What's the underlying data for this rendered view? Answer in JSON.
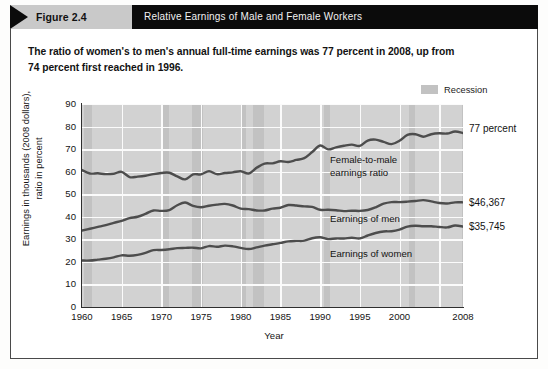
{
  "header": {
    "figure_number": "Figure 2.4",
    "title": "Relative Earnings of Male and Female Workers"
  },
  "subtitle": "The ratio of women's to men's annual full-time earnings was 77 percent in 2008, up from 74 percent first reached in 1996.",
  "legend": {
    "recession_label": "Recession",
    "recession_color": "#c2c2c2"
  },
  "annotations": {
    "ratio_note": "Female-to-male\nearnings ratio",
    "men_note": "Earnings of men",
    "women_note": "Earnings of women",
    "ratio_end": "77 percent",
    "men_end": "$46,367",
    "women_end": "$35,745"
  },
  "axes": {
    "ylabel": "Earnings in thousands (2008 dollars),\nratio in percent",
    "xlabel": "Year",
    "yticks": [
      "90",
      "80",
      "70",
      "60",
      "50",
      "40",
      "30",
      "20",
      "10",
      "0"
    ],
    "xticks": [
      "1960",
      "1965",
      "1970",
      "1975",
      "1980",
      "1985",
      "1990",
      "1995",
      "2000",
      "2008"
    ]
  },
  "chart_data": {
    "type": "line",
    "title": "Relative Earnings of Male and Female Workers",
    "subtitle": "The ratio of women's to men's annual full-time earnings was 77 percent in 2008, up from 74 percent first reached in 1996.",
    "xlabel": "Year",
    "ylabel": "Earnings in thousands (2008 dollars), ratio in percent",
    "xlim": [
      1960,
      2008
    ],
    "ylim": [
      0,
      90
    ],
    "ytick_step": 10,
    "grid": true,
    "legend_position": "top-right",
    "line_color": "#4d4d4d",
    "plot_background": "#d2d2d2",
    "x": [
      1960,
      1961,
      1962,
      1963,
      1964,
      1965,
      1966,
      1967,
      1968,
      1969,
      1970,
      1971,
      1972,
      1973,
      1974,
      1975,
      1976,
      1977,
      1978,
      1979,
      1980,
      1981,
      1982,
      1983,
      1984,
      1985,
      1986,
      1987,
      1988,
      1989,
      1990,
      1991,
      1992,
      1993,
      1994,
      1995,
      1996,
      1997,
      1998,
      1999,
      2000,
      2001,
      2002,
      2003,
      2004,
      2005,
      2006,
      2007,
      2008
    ],
    "series": [
      {
        "name": "Female-to-male earnings ratio",
        "unit": "percent",
        "end_label": "77 percent",
        "values": [
          60.7,
          59.2,
          59.3,
          58.9,
          59.1,
          59.9,
          57.6,
          57.8,
          58.2,
          58.9,
          59.4,
          59.5,
          57.9,
          56.6,
          58.8,
          58.8,
          60.2,
          58.9,
          59.4,
          59.7,
          60.2,
          59.2,
          61.7,
          63.6,
          63.7,
          64.6,
          64.3,
          65.2,
          66.0,
          68.7,
          71.6,
          69.9,
          70.8,
          71.5,
          72.0,
          71.4,
          73.8,
          74.2,
          73.2,
          72.2,
          73.7,
          76.3,
          76.6,
          75.5,
          76.6,
          77.0,
          76.9,
          77.8,
          77.1
        ]
      },
      {
        "name": "Earnings of men",
        "unit": "thousands of 2008 dollars",
        "end_label": "$46,367",
        "values": [
          33.9,
          34.7,
          35.5,
          36.3,
          37.3,
          38.2,
          39.4,
          40.0,
          41.3,
          42.8,
          42.6,
          43.0,
          45.1,
          46.3,
          44.8,
          44.2,
          44.9,
          45.4,
          45.7,
          45.0,
          43.6,
          43.4,
          42.8,
          42.8,
          43.6,
          44.0,
          45.2,
          45.0,
          44.6,
          44.4,
          43.1,
          43.1,
          42.9,
          42.5,
          42.7,
          42.6,
          43.0,
          44.2,
          45.8,
          46.5,
          46.5,
          46.7,
          47.0,
          47.4,
          46.8,
          46.1,
          45.9,
          46.4,
          46.4
        ]
      },
      {
        "name": "Earnings of women",
        "unit": "thousands of 2008 dollars",
        "end_label": "$35,745",
        "values": [
          20.6,
          20.6,
          21.0,
          21.4,
          22.0,
          22.9,
          22.7,
          23.1,
          24.0,
          25.2,
          25.3,
          25.6,
          26.1,
          26.2,
          26.3,
          26.0,
          27.0,
          26.7,
          27.2,
          26.9,
          26.2,
          25.7,
          26.4,
          27.2,
          27.8,
          28.4,
          29.1,
          29.3,
          29.4,
          30.5,
          30.9,
          30.1,
          30.4,
          30.4,
          30.7,
          30.4,
          31.7,
          32.8,
          33.5,
          33.6,
          34.3,
          35.6,
          36.0,
          35.8,
          35.8,
          35.5,
          35.3,
          36.1,
          35.7
        ]
      }
    ],
    "recessions": [
      {
        "start": 1960.3,
        "end": 1961.2
      },
      {
        "start": 1969.9,
        "end": 1970.9
      },
      {
        "start": 1973.9,
        "end": 1975.2
      },
      {
        "start": 1980.0,
        "end": 1980.6
      },
      {
        "start": 1981.5,
        "end": 1982.9
      },
      {
        "start": 1990.5,
        "end": 1991.2
      },
      {
        "start": 2001.2,
        "end": 2001.9
      },
      {
        "start": 2007.9,
        "end": 2008.0
      }
    ]
  }
}
